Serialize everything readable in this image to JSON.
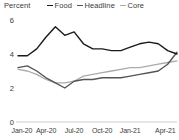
{
  "header": {
    "unit_label": "Percent"
  },
  "legend": {
    "position": "top",
    "items": [
      {
        "label": "Food",
        "color": "#1a1a1a"
      },
      {
        "label": "Headline",
        "color": "#555555"
      },
      {
        "label": "Core",
        "color": "#aaaaaa"
      }
    ]
  },
  "axes": {
    "y_ticks": [
      "0",
      "2",
      "4",
      "6"
    ],
    "x_ticks": [
      "Jan-20",
      "Apr-20",
      "Jul-20",
      "Oct-20",
      "Jan-21",
      "Apr-21"
    ],
    "baseline_color": "#bfbfbf"
  },
  "chart_data": {
    "type": "line",
    "title": "",
    "subtitle": "",
    "xlabel": "",
    "ylabel": "Percent",
    "ylim": [
      0,
      6
    ],
    "yticks": [
      0,
      2,
      4,
      6
    ],
    "grid": false,
    "legend_position": "top",
    "x": [
      "Jan-20",
      "Feb-20",
      "Mar-20",
      "Apr-20",
      "May-20",
      "Jun-20",
      "Jul-20",
      "Aug-20",
      "Sep-20",
      "Oct-20",
      "Nov-20",
      "Dec-20",
      "Jan-21",
      "Feb-21",
      "Mar-21",
      "Apr-21",
      "May-21",
      "Jun-21"
    ],
    "xtick_labels": [
      "Jan-20",
      "Apr-20",
      "Jul-20",
      "Oct-20",
      "Jan-21",
      "Apr-21"
    ],
    "series": [
      {
        "name": "Food",
        "color": "#1a1a1a",
        "values": [
          3.9,
          3.9,
          4.3,
          5.0,
          5.6,
          5.1,
          5.3,
          4.6,
          4.3,
          4.3,
          4.2,
          4.2,
          4.4,
          4.6,
          4.7,
          4.6,
          4.2,
          4.0
        ]
      },
      {
        "name": "Headline",
        "color": "#555555",
        "values": [
          3.2,
          3.3,
          3.0,
          2.6,
          2.3,
          2.0,
          2.4,
          2.5,
          2.5,
          2.6,
          2.6,
          2.6,
          2.7,
          2.8,
          2.9,
          3.0,
          3.4,
          4.1
        ]
      },
      {
        "name": "Core",
        "color": "#aaaaaa",
        "values": [
          3.1,
          3.0,
          2.8,
          2.5,
          2.3,
          2.3,
          2.4,
          2.7,
          2.8,
          2.9,
          3.0,
          3.1,
          3.2,
          3.2,
          3.3,
          3.4,
          3.5,
          3.6
        ]
      }
    ]
  }
}
